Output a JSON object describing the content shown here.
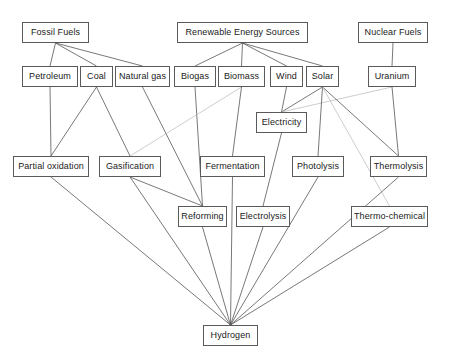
{
  "diagram": {
    "type": "flow-diagram",
    "canvas": {
      "width": 449,
      "height": 360
    },
    "style": {
      "background": "#ffffff",
      "node_border": "#5a5a5a",
      "node_fill": "#ffffff",
      "text_color": "#1a1a1a",
      "edge_color": "#555555",
      "edge_color_faint": "#b8b8b8"
    },
    "nodes": [
      {
        "id": "fossil_fuels",
        "label": "Fossil Fuels",
        "x": 22,
        "y": 22,
        "w": 67,
        "h": 21,
        "level": 0
      },
      {
        "id": "renewable_sources",
        "label": "Renewable Energy Sources",
        "x": 177,
        "y": 22,
        "w": 131,
        "h": 21,
        "level": 0
      },
      {
        "id": "nuclear_fuels",
        "label": "Nuclear Fuels",
        "x": 358,
        "y": 22,
        "w": 70,
        "h": 21,
        "level": 0
      },
      {
        "id": "petroleum",
        "x": 22,
        "y": 66,
        "w": 56,
        "h": 21,
        "label": "Petroleum",
        "level": 1
      },
      {
        "id": "coal",
        "x": 80,
        "y": 66,
        "w": 33,
        "h": 21,
        "label": "Coal",
        "level": 1
      },
      {
        "id": "natural_gas",
        "x": 115,
        "y": 66,
        "w": 55,
        "h": 21,
        "label": "Natural gas",
        "level": 1
      },
      {
        "id": "biogas",
        "x": 174,
        "y": 66,
        "w": 42,
        "h": 21,
        "label": "Biogas",
        "level": 1
      },
      {
        "id": "biomass",
        "x": 218,
        "y": 66,
        "w": 47,
        "h": 21,
        "label": "Biomass",
        "level": 1
      },
      {
        "id": "wind",
        "x": 270,
        "y": 66,
        "w": 33,
        "h": 21,
        "label": "Wind",
        "level": 1
      },
      {
        "id": "solar",
        "x": 306,
        "y": 66,
        "w": 33,
        "h": 21,
        "label": "Solar",
        "level": 1
      },
      {
        "id": "uranium",
        "x": 368,
        "y": 66,
        "w": 48,
        "h": 21,
        "label": "Uranium",
        "level": 1
      },
      {
        "id": "electricity",
        "x": 256,
        "y": 112,
        "w": 51,
        "h": 21,
        "label": "Electricity",
        "level": 2
      },
      {
        "id": "partial_oxidation",
        "x": 13,
        "y": 156,
        "w": 76,
        "h": 21,
        "label": "Partial oxidation",
        "level": 3
      },
      {
        "id": "gasification",
        "x": 99,
        "y": 156,
        "w": 62,
        "h": 21,
        "label": "Gasification",
        "level": 3
      },
      {
        "id": "fermentation",
        "x": 200,
        "y": 156,
        "w": 65,
        "h": 21,
        "label": "Fermentation",
        "level": 3
      },
      {
        "id": "photolysis",
        "x": 292,
        "y": 156,
        "w": 52,
        "h": 21,
        "label": "Photolysis",
        "level": 3
      },
      {
        "id": "thermolysis",
        "x": 370,
        "y": 156,
        "w": 57,
        "h": 21,
        "label": "Thermolysis",
        "level": 3
      },
      {
        "id": "reforming",
        "x": 178,
        "y": 206,
        "w": 49,
        "h": 21,
        "label": "Reforming",
        "level": 4
      },
      {
        "id": "electrolysis",
        "x": 236,
        "y": 206,
        "w": 54,
        "h": 21,
        "label": "Electrolysis",
        "level": 4
      },
      {
        "id": "thermo_chemical",
        "x": 351,
        "y": 206,
        "w": 77,
        "h": 21,
        "label": "Thermo-chemical",
        "level": 4
      },
      {
        "id": "hydrogen",
        "x": 203,
        "y": 325,
        "w": 55,
        "h": 21,
        "label": "Hydrogen",
        "level": 5
      }
    ],
    "edges": [
      {
        "from": "fossil_fuels",
        "to": "petroleum",
        "faint": false
      },
      {
        "from": "fossil_fuels",
        "to": "coal",
        "faint": false
      },
      {
        "from": "fossil_fuels",
        "to": "natural_gas",
        "faint": false
      },
      {
        "from": "renewable_sources",
        "to": "biogas",
        "faint": false
      },
      {
        "from": "renewable_sources",
        "to": "biomass",
        "faint": false
      },
      {
        "from": "renewable_sources",
        "to": "wind",
        "faint": false
      },
      {
        "from": "renewable_sources",
        "to": "solar",
        "faint": false
      },
      {
        "from": "nuclear_fuels",
        "to": "uranium",
        "faint": false
      },
      {
        "from": "petroleum",
        "to": "partial_oxidation",
        "faint": false
      },
      {
        "from": "coal",
        "to": "partial_oxidation",
        "faint": false
      },
      {
        "from": "coal",
        "to": "gasification",
        "faint": false
      },
      {
        "from": "natural_gas",
        "to": "reforming",
        "faint": false
      },
      {
        "from": "biogas",
        "to": "reforming",
        "faint": false
      },
      {
        "from": "biomass",
        "to": "gasification",
        "faint": true
      },
      {
        "from": "biomass",
        "to": "fermentation",
        "faint": false
      },
      {
        "from": "wind",
        "to": "electricity",
        "faint": false
      },
      {
        "from": "solar",
        "to": "electricity",
        "faint": false
      },
      {
        "from": "uranium",
        "to": "electricity",
        "faint": true
      },
      {
        "from": "uranium",
        "to": "thermolysis",
        "faint": false
      },
      {
        "from": "solar",
        "to": "photolysis",
        "faint": false
      },
      {
        "from": "solar",
        "to": "thermolysis",
        "faint": false
      },
      {
        "from": "solar",
        "to": "thermo_chemical",
        "faint": true
      },
      {
        "from": "electricity",
        "to": "electrolysis",
        "faint": false
      },
      {
        "from": "gasification",
        "to": "reforming",
        "faint": false
      },
      {
        "from": "fermentation",
        "to": "hydrogen",
        "faint": false
      },
      {
        "from": "partial_oxidation",
        "to": "hydrogen",
        "faint": false
      },
      {
        "from": "gasification",
        "to": "hydrogen",
        "faint": false
      },
      {
        "from": "reforming",
        "to": "hydrogen",
        "faint": false
      },
      {
        "from": "electrolysis",
        "to": "hydrogen",
        "faint": false
      },
      {
        "from": "photolysis",
        "to": "hydrogen",
        "faint": false
      },
      {
        "from": "thermolysis",
        "to": "hydrogen",
        "faint": false
      },
      {
        "from": "thermo_chemical",
        "to": "hydrogen",
        "faint": false
      }
    ]
  }
}
